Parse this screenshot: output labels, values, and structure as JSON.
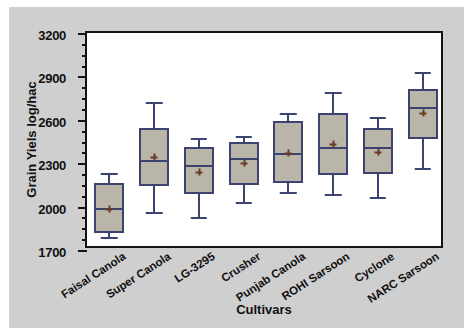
{
  "chart_data": {
    "type": "box",
    "title": "",
    "xlabel": "Cultivars",
    "ylabel": "Grain Yiels log/hac",
    "ylim": [
      1700,
      3200
    ],
    "ytick_labels": [
      "3200",
      "2900",
      "2600",
      "2300",
      "2000",
      "1700"
    ],
    "ytick_values": [
      3200,
      2900,
      2600,
      2300,
      2000,
      1700
    ],
    "ytick_minor_step": 75,
    "grid": false,
    "legend": "none",
    "categories": [
      "Faisal Canola",
      "Super Canola",
      "LG-3295",
      "Crusher",
      "Punjab Canola",
      "ROHI Sarsoon",
      "Cyclone",
      "NARC Sarsoon"
    ],
    "boxes": [
      {
        "label": "Faisal Canola",
        "whisker_low": 1790,
        "q1": 1815,
        "median": 1990,
        "q3": 2160,
        "whisker_high": 2235,
        "mean": 1985
      },
      {
        "label": "Super Canola",
        "whisker_low": 1960,
        "q1": 2140,
        "median": 2320,
        "q3": 2545,
        "whisker_high": 2720,
        "mean": 2340
      },
      {
        "label": "LG-3295",
        "whisker_low": 1925,
        "q1": 2090,
        "median": 2290,
        "q3": 2410,
        "whisker_high": 2475,
        "mean": 2240
      },
      {
        "label": "Crusher",
        "whisker_low": 2030,
        "q1": 2150,
        "median": 2335,
        "q3": 2450,
        "whisker_high": 2490,
        "mean": 2300
      },
      {
        "label": "Punjab Canola",
        "whisker_low": 2100,
        "q1": 2160,
        "median": 2370,
        "q3": 2590,
        "whisker_high": 2650,
        "mean": 2370
      },
      {
        "label": "ROHI Sarsoon",
        "whisker_low": 2085,
        "q1": 2220,
        "median": 2415,
        "q3": 2645,
        "whisker_high": 2790,
        "mean": 2430
      },
      {
        "label": "Cyclone",
        "whisker_low": 2065,
        "q1": 2225,
        "median": 2415,
        "q3": 2545,
        "whisker_high": 2620,
        "mean": 2380
      },
      {
        "label": "NARC Sarsoon",
        "whisker_low": 2265,
        "q1": 2470,
        "median": 2690,
        "q3": 2815,
        "whisker_high": 2930,
        "mean": 2650
      }
    ],
    "colors": {
      "figure_background": "#cfcfcf",
      "plot_background": "#ffffff",
      "box_fill": "#b9b5a8",
      "box_edge": "#3b4370",
      "mean_marker": "#6b3b22",
      "axis": "#141414",
      "text": "#111111"
    }
  }
}
